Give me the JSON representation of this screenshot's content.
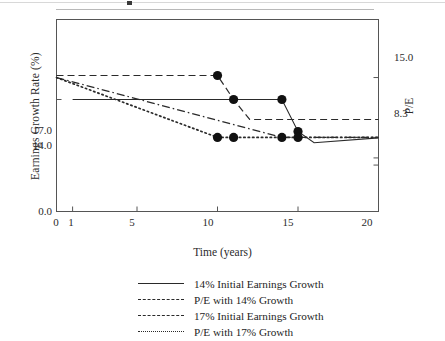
{
  "chart_data": {
    "type": "line",
    "title": "",
    "xlabel": "Time (years)",
    "ylabel": "Earnings Growth Rate (%)",
    "ylabel_right": "P/E",
    "xlim": [
      0,
      20
    ],
    "xticks": [
      0,
      1,
      5,
      10,
      15,
      20
    ],
    "xticklabels": [
      "0",
      "1",
      "5",
      "10",
      "15",
      "20"
    ],
    "left_axis": {
      "ticks": [
        0.0,
        14.0,
        17.0
      ],
      "ticklabels": [
        "0.0",
        "14.0",
        "17.0"
      ],
      "ylim": [
        0.0,
        24.0
      ]
    },
    "right_axis": {
      "ticks": [
        8.3,
        15.0
      ],
      "ticklabels": [
        "8.3",
        "15.0"
      ],
      "ylim": [
        0.0,
        21.5
      ]
    },
    "grid": false,
    "legend_position": "below-axes",
    "series": [
      {
        "name": "14% Initial Earnings Growth",
        "style": "solid",
        "axis": "left",
        "x": [
          1,
          11,
          14,
          15,
          16,
          20
        ],
        "y": [
          14.0,
          14.0,
          14.0,
          10.0,
          8.6,
          9.2
        ],
        "markers": [
          {
            "x": 11,
            "y": 14.0
          },
          {
            "x": 14,
            "y": 14.0
          },
          {
            "x": 15,
            "y": 10.0
          }
        ]
      },
      {
        "name": "P/E with 14% Growth",
        "style": "dashdot",
        "axis": "right",
        "x": [
          0,
          14,
          20
        ],
        "y": [
          15.0,
          8.3,
          8.3
        ],
        "markers": []
      },
      {
        "name": "17% Initial Earnings Growth",
        "style": "dashed",
        "axis": "left",
        "x": [
          0,
          10,
          11,
          12,
          20
        ],
        "y": [
          17.0,
          17.0,
          14.0,
          11.5,
          11.5
        ],
        "markers": [
          {
            "x": 10,
            "y": 17.0
          }
        ]
      },
      {
        "name": "P/E with 17% Growth",
        "style": "dotted",
        "axis": "right",
        "x": [
          0,
          10,
          20
        ],
        "y": [
          15.0,
          8.3,
          8.3
        ],
        "markers": [
          {
            "x": 10,
            "y": 8.3
          },
          {
            "x": 11,
            "y": 8.3
          },
          {
            "x": 14,
            "y": 8.3
          },
          {
            "x": 15,
            "y": 8.3
          }
        ]
      }
    ],
    "legend": [
      {
        "label": "14% Initial Earnings Growth",
        "style": "solid"
      },
      {
        "label": "P/E with 14% Growth",
        "style": "dashdot"
      },
      {
        "label": "17% Initial Earnings Growth",
        "style": "dashed"
      },
      {
        "label": "P/E with 17% Growth",
        "style": "dotted"
      }
    ],
    "colors": {
      "line": "#2a2a2a",
      "marker": "#111111",
      "axis": "#4a4a4a",
      "text": "#2b2b2b",
      "background": "#ffffff"
    }
  },
  "axis_ticks": {
    "y_left": [
      "17.0",
      "14.0",
      "0.0"
    ],
    "y_right": [
      "15.0",
      "8.3"
    ],
    "x": [
      "0",
      "1",
      "5",
      "10",
      "15",
      "20"
    ]
  },
  "labels": {
    "y_left_title": "Earnings Growth Rate (%)",
    "y_right_title": "P/E",
    "x_title": "Time (years)"
  },
  "legend_labels": {
    "s0": "14% Initial Earnings Growth",
    "s1": "P/E with 14% Growth",
    "s2": "17% Initial Earnings Growth",
    "s3": "P/E with 17% Growth"
  }
}
